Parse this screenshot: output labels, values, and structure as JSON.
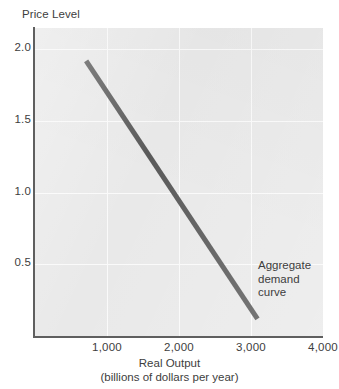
{
  "chart_data": {
    "type": "line",
    "title": "",
    "xlabel": "Real Output",
    "xlabel_sub": "(billions of dollars per year)",
    "ylabel": "Price Level",
    "xlim": [
      0,
      4000
    ],
    "ylim": [
      0,
      2.15
    ],
    "grid": true,
    "legend": "none",
    "plot_bg": "#e9e9e9",
    "axis_color": "#5f5f5f",
    "gridline_color": "#fafafa",
    "xticks": [
      {
        "value": 1000,
        "label": "1,000"
      },
      {
        "value": 2000,
        "label": "2,000"
      },
      {
        "value": 3000,
        "label": "3,000"
      },
      {
        "value": 4000,
        "label": "4,000"
      }
    ],
    "yticks": [
      {
        "value": 2.0,
        "label": "2.0"
      },
      {
        "value": 1.5,
        "label": "1.5"
      },
      {
        "value": 1.0,
        "label": "1.0"
      },
      {
        "value": 0.5,
        "label": "0.5"
      }
    ],
    "series": [
      {
        "name": "Aggregate demand curve",
        "color": "#5a5a5a",
        "width": 5,
        "points": [
          {
            "x": 710,
            "y": 1.92
          },
          {
            "x": 3090,
            "y": 0.12
          }
        ]
      }
    ],
    "annotations": [
      {
        "name": "aggregate-demand-curve-label",
        "lines": [
          "Aggregate",
          "demand",
          "curve"
        ],
        "x": 3090,
        "y": 0.62
      }
    ]
  },
  "annotation_lines": {
    "line1": "Aggregate",
    "line2": "demand",
    "line3": "curve"
  }
}
